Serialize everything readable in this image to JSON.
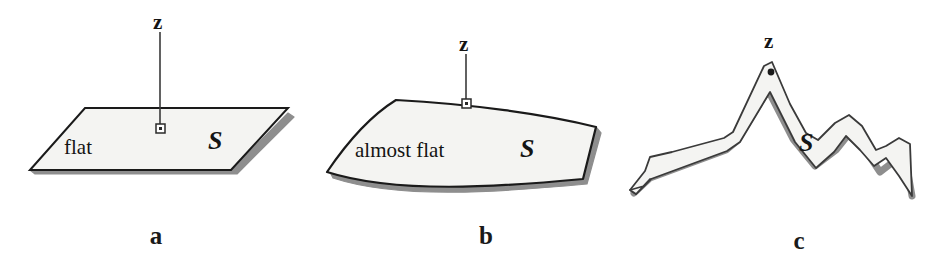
{
  "figure": {
    "caption_labels": [
      "a",
      "b",
      "c"
    ],
    "point_label": "z",
    "surface_label": "S",
    "colors": {
      "stroke": "#1a1a1a",
      "fill": "#f4f4f2",
      "shadow": "#8e8e8e",
      "background": "#ffffff",
      "text": "#141414"
    }
  },
  "panels": [
    {
      "id": "a",
      "label": "a",
      "descriptor": "flat",
      "surface_label": "S",
      "point_label": "z",
      "surface_type": "flat-plane",
      "marker": "open-square",
      "has_normal_line": true
    },
    {
      "id": "b",
      "label": "b",
      "descriptor": "almost flat",
      "surface_label": "S",
      "point_label": "z",
      "surface_type": "gently-curved-patch",
      "marker": "open-square",
      "has_normal_line": true
    },
    {
      "id": "c",
      "label": "c",
      "descriptor": "",
      "surface_label": "S",
      "point_label": "z",
      "surface_type": "jagged-ridge",
      "marker": "filled-dot",
      "has_normal_line": false
    }
  ]
}
